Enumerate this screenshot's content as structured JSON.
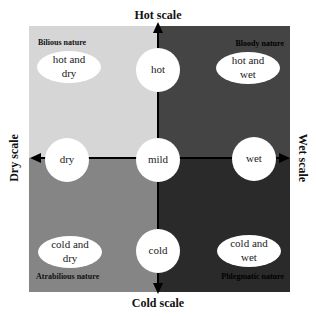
{
  "colors": {
    "quadrant_top_left": "#d6d6d6",
    "quadrant_top_right": "#444444",
    "quadrant_bottom_left": "#858585",
    "quadrant_bottom_right": "#2a2a2a",
    "axis": "#000000",
    "node_fill": "#ffffff"
  },
  "axes": {
    "top": "Hot scale",
    "bottom": "Cold scale",
    "left": "Dry scale",
    "right": "Wet scale"
  },
  "quadrants": {
    "top_left": {
      "label": "Bilious nature",
      "ellipse": [
        "hot and",
        "dry"
      ]
    },
    "top_right": {
      "label": "Bloody nature",
      "ellipse": [
        "hot and",
        "wet"
      ]
    },
    "bottom_left": {
      "label": "Atrabilious nature",
      "ellipse": [
        "cold and",
        "dry"
      ]
    },
    "bottom_right": {
      "label": "Phlegmatic nature",
      "ellipse": [
        "cold and",
        "wet"
      ]
    }
  },
  "nodes": {
    "top": "hot",
    "bottom": "cold",
    "left": "dry",
    "right": "wet",
    "center": "mild"
  }
}
